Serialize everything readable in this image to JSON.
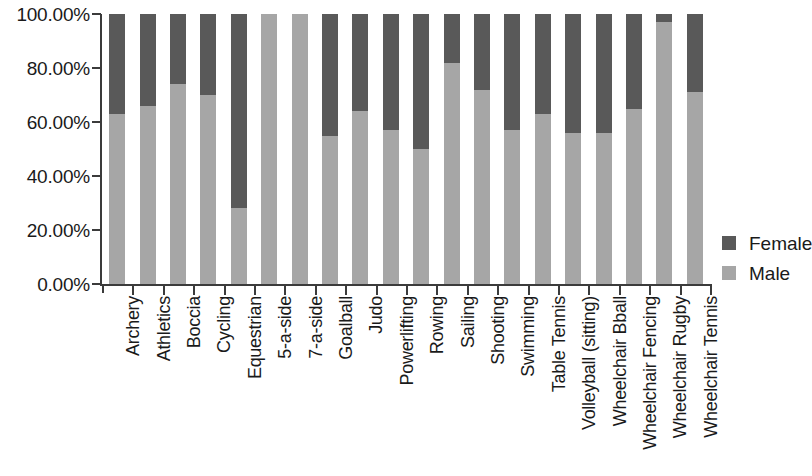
{
  "chart_data": {
    "type": "bar",
    "subtype": "stacked-100-percent",
    "title": "",
    "xlabel": "",
    "ylabel": "",
    "ylim": [
      0,
      100
    ],
    "grid": false,
    "legend_position": "right",
    "y_tick_labels": [
      "100.00%",
      "80.00%",
      "60.00%",
      "40.00%",
      "20.00%",
      "0.00%"
    ],
    "y_tick_values": [
      100,
      80,
      60,
      40,
      20,
      0
    ],
    "categories": [
      "Archery",
      "Athletics",
      "Boccia",
      "Cycling",
      "Equestrian",
      "5-a-side",
      "7-a-side",
      "Goalball",
      "Judo",
      "Powerlifting",
      "Rowing",
      "Sailing",
      "Shooting",
      "Swimming",
      "Table Tennis",
      "Volleyball (sitting)",
      "Wheelchair Bball",
      "Wheelchair Fencing",
      "Wheelchair Rugby",
      "Wheelchair Tennis"
    ],
    "series": [
      {
        "name": "Female",
        "color": "#595959",
        "values": [
          37.0,
          34.0,
          26.0,
          30.0,
          72.0,
          0.0,
          0.0,
          45.0,
          36.0,
          43.0,
          50.0,
          18.0,
          28.0,
          43.0,
          37.0,
          44.0,
          44.0,
          35.0,
          3.0,
          29.0
        ]
      },
      {
        "name": "Male",
        "color": "#a6a6a6",
        "values": [
          63.0,
          66.0,
          74.0,
          70.0,
          28.0,
          100.0,
          100.0,
          55.0,
          64.0,
          57.0,
          50.0,
          82.0,
          72.0,
          57.0,
          63.0,
          56.0,
          56.0,
          65.0,
          97.0,
          71.0
        ]
      }
    ]
  },
  "legend": {
    "entries": [
      {
        "label": "Female",
        "color": "#595959"
      },
      {
        "label": "Male",
        "color": "#a6a6a6"
      }
    ]
  },
  "colors": {
    "female": "#595959",
    "male": "#a6a6a6",
    "axis": "#3b3b3b",
    "text": "#1a1a1a",
    "background": "#ffffff"
  }
}
